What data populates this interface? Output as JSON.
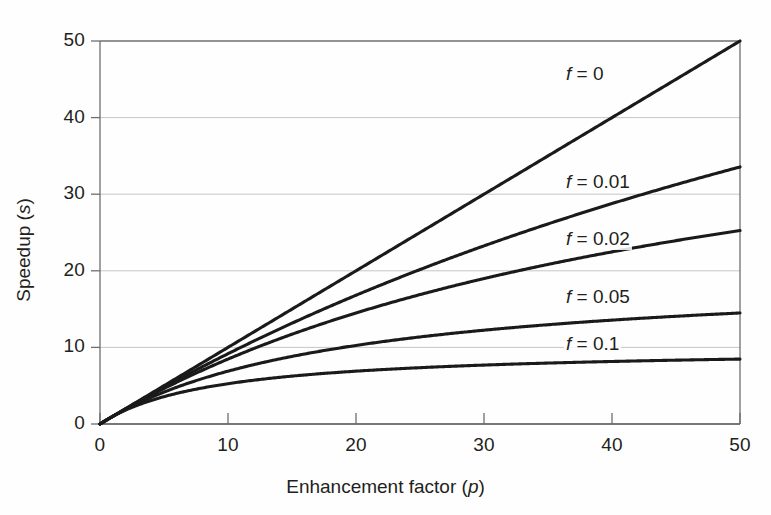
{
  "chart_data": {
    "type": "line",
    "title": "",
    "xlabel": "Enhancement factor (p)",
    "xlabel_text": "Enhancement factor",
    "xlabel_var": "p",
    "ylabel": "Speedup (s)",
    "ylabel_text": "Speedup",
    "ylabel_var": "s",
    "xlim": [
      0,
      50
    ],
    "ylim": [
      0,
      50
    ],
    "xticks": [
      0,
      10,
      20,
      30,
      40,
      50
    ],
    "yticks": [
      0,
      10,
      20,
      30,
      40,
      50
    ],
    "xtick_labels": [
      "0",
      "10",
      "20",
      "30",
      "40",
      "50"
    ],
    "ytick_labels": [
      "0",
      "10",
      "20",
      "30",
      "40",
      "50"
    ],
    "grid": "horizontal",
    "grid_color": "#8c8c8c",
    "line_color": "#1a1a1a",
    "axis_color": "#6e6e6e",
    "background": "#fefefe",
    "legend_position": "inline-right",
    "formula": "s = 1 / (f + (1 - f) / p)",
    "series": [
      {
        "name": "f = 0",
        "label_text": "f = 0",
        "f": 0,
        "x": [
          0,
          2,
          5,
          10,
          15,
          20,
          25,
          30,
          35,
          40,
          45,
          50
        ],
        "values": [
          0,
          2,
          5,
          10,
          15,
          20,
          25,
          30,
          35,
          40,
          45,
          50
        ],
        "endpoint": 50,
        "label_x": 40.0,
        "label_y": 45.5
      },
      {
        "name": "f = 0.01",
        "label_text": "f = 0.01",
        "f": 0.01,
        "x": [
          0,
          2,
          5,
          10,
          15,
          20,
          25,
          30,
          35,
          40,
          45,
          50
        ],
        "values": [
          0,
          1.98,
          4.81,
          9.17,
          13.16,
          16.81,
          20.17,
          23.26,
          26.12,
          28.78,
          31.25,
          33.56
        ],
        "endpoint": 33.56,
        "label_x": 40.0,
        "label_y": 31.5
      },
      {
        "name": "f = 0.02",
        "label_text": "f = 0.02",
        "f": 0.02,
        "x": [
          0,
          2,
          5,
          10,
          15,
          20,
          25,
          30,
          35,
          40,
          45,
          50
        ],
        "values": [
          0,
          1.96,
          4.63,
          8.47,
          11.86,
          14.88,
          17.57,
          19.98,
          22.15,
          24.1,
          25.88,
          25.0
        ],
        "endpoint": 25.25,
        "label_x": 40.0,
        "label_y": 24.0
      },
      {
        "name": "f = 0.05",
        "label_text": "f = 0.05",
        "f": 0.05,
        "x": [
          0,
          2,
          5,
          10,
          15,
          20,
          25,
          30,
          35,
          40,
          45,
          50
        ],
        "values": [
          0,
          1.9,
          4.17,
          6.9,
          8.82,
          10.26,
          11.36,
          12.24,
          12.96,
          13.56,
          14.06,
          14.1
        ],
        "endpoint": 14.08,
        "label_x": 40.0,
        "label_y": 16.5
      },
      {
        "name": "f = 0.1",
        "label_text": "f = 0.1",
        "f": 0.1,
        "x": [
          0,
          2,
          5,
          10,
          15,
          20,
          25,
          30,
          35,
          40,
          45,
          50
        ],
        "values": [
          0,
          1.82,
          3.57,
          5.26,
          6.25,
          6.9,
          7.35,
          7.69,
          7.95,
          8.16,
          8.33,
          8.47
        ],
        "endpoint": 8.47,
        "label_x": 40.0,
        "label_y": 10.3
      }
    ]
  }
}
